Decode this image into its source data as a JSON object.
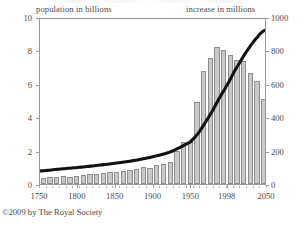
{
  "chart_data": {
    "type": "bar",
    "title": "",
    "subtitle": "",
    "credit": "©2009 by The Royal Society",
    "xlabel": "",
    "ylabel": "population in billions",
    "y2label": "increase in millions",
    "xlim": [
      1750,
      2050
    ],
    "ylim": [
      0,
      10
    ],
    "y2lim": [
      0,
      1000
    ],
    "grid": false,
    "legend_position": "none",
    "x_ticks": [
      "1750",
      "1800",
      "1850",
      "1900",
      "1950",
      "1998",
      "2050"
    ],
    "x_tick_values": [
      1750,
      1800,
      1850,
      1900,
      1950,
      1998,
      2050
    ],
    "y_ticks": [
      "0",
      "2",
      "4",
      "6",
      "8",
      "10"
    ],
    "y_tick_values": [
      0,
      2,
      4,
      6,
      8,
      10
    ],
    "y2_ticks": [
      "0",
      "200",
      "400",
      "600",
      "800",
      "1000"
    ],
    "y2_tick_values": [
      0,
      200,
      400,
      600,
      800,
      1000
    ],
    "series": [
      {
        "name": "increase in millions",
        "type": "bar",
        "axis": "right",
        "color": "#c9c9c9",
        "edge_color": "#8e8e8e",
        "x": [
          1755,
          1765,
          1775,
          1785,
          1795,
          1805,
          1815,
          1825,
          1835,
          1845,
          1855,
          1865,
          1875,
          1885,
          1895,
          1905,
          1915,
          1925,
          1935,
          1945,
          1955,
          1965,
          1975,
          1985,
          1995,
          2005,
          2015,
          2025,
          2035,
          2045
        ],
        "values": [
          38,
          40,
          42,
          48,
          45,
          50,
          55,
          60,
          62,
          66,
          72,
          70,
          78,
          84,
          92,
          100,
          96,
          112,
          120,
          130,
          195,
          250,
          250,
          490,
          675,
          755,
          820,
          805,
          770,
          745
        ]
      },
      {
        "name": "population in billions",
        "type": "line",
        "axis": "left",
        "color": "#111111",
        "x": [
          1750,
          1775,
          1800,
          1825,
          1850,
          1875,
          1900,
          1925,
          1950,
          1960,
          1970,
          1980,
          1990,
          1998,
          2010,
          2025,
          2040,
          2050
        ],
        "values": [
          0.79,
          0.9,
          1.0,
          1.12,
          1.26,
          1.42,
          1.65,
          1.97,
          2.53,
          3.02,
          3.7,
          4.44,
          5.27,
          5.9,
          6.9,
          8.0,
          8.9,
          9.32
        ]
      }
    ],
    "bar_values_full": [
      38,
      40,
      42,
      48,
      45,
      50,
      55,
      60,
      62,
      66,
      72,
      70,
      78,
      84,
      92,
      100,
      96,
      112,
      120,
      130,
      195,
      250,
      250,
      490,
      675,
      755,
      820,
      805,
      770,
      745,
      735,
      665,
      615,
      510
    ],
    "bar_x_full": [
      1755,
      1765,
      1775,
      1785,
      1795,
      1805,
      1815,
      1825,
      1835,
      1845,
      1855,
      1865,
      1875,
      1885,
      1895,
      1905,
      1915,
      1925,
      1935,
      1945,
      1955,
      1965,
      1975,
      1985,
      1992,
      1998,
      2004,
      2010,
      2016,
      2022,
      2028,
      2034,
      2040,
      2046
    ]
  },
  "captions": {
    "left": "population in billions",
    "right": "increase in millions"
  },
  "footer": {
    "credit": "©2009 by The Royal Society"
  },
  "colors": {
    "bar_fill": "#c9c9c9",
    "bar_edge": "#8e8e8e",
    "line": "#111111",
    "frame": "#9a9a9a",
    "text": "#4a4a4a"
  }
}
